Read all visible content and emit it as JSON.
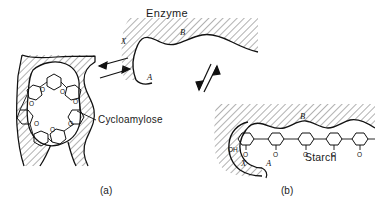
{
  "figure": {
    "title_labels": {
      "enzyme": "Enzyme",
      "cycloamylose": "Cycloamylose",
      "starch": "Starch"
    },
    "panels": [
      {
        "key": "a",
        "caption": "(a)",
        "description": "Cycloamylose bound in enzyme cleft"
      },
      {
        "key": "b",
        "caption": "(b)",
        "description": "Starch bound in enzyme cleft"
      }
    ],
    "binding_sites": {
      "x_left": "X",
      "b_top": "B",
      "a_bottom": "A",
      "x_panel_b": "X",
      "a_panel_b": "A",
      "b_panel_b": "B"
    },
    "chemistry": {
      "bridge_oxygen": "O",
      "hydroxyl": "OH",
      "cycloamylose_ring_units": 7,
      "starch_chain_units": 5,
      "cycloamylose_bridge_oxygens": 7,
      "starch_bridge_oxygens": 5
    },
    "arrows": {
      "panel_a_pair": "double-headed exchange arrows",
      "center_pair": "vertical equilibrium arrows"
    },
    "colors": {
      "ink": "#1a1a1a",
      "hatch": "#555555",
      "background": "#ffffff"
    }
  }
}
